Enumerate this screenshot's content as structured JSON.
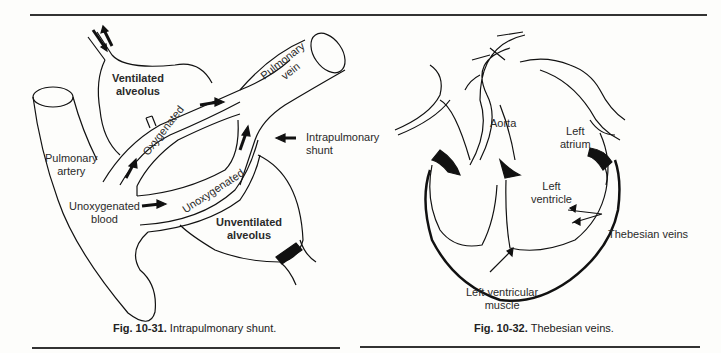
{
  "figures": [
    {
      "id": "fig-10-31",
      "caption_number": "Fig. 10-31.",
      "caption_text": "Intrapulmonary shunt.",
      "labels": {
        "ventilated_alveolus_1": "Ventilated",
        "ventilated_alveolus_2": "alveolus",
        "pulmonary_vein_1": "Pulmonary",
        "pulmonary_vein_2": "vein",
        "oxygenated": "Oxygenated",
        "intrapulmonary_shunt_1": "Intrapulmonary",
        "intrapulmonary_shunt_2": "shunt",
        "pulmonary_artery_1": "Pulmonary",
        "pulmonary_artery_2": "artery",
        "unoxygenated_blood_1": "Unoxygenated",
        "unoxygenated_blood_2": "blood",
        "unoxygenated": "Unoxygenated",
        "unventilated_alveolus_1": "Unventilated",
        "unventilated_alveolus_2": "alveolus"
      }
    },
    {
      "id": "fig-10-32",
      "caption_number": "Fig. 10-32.",
      "caption_text": "Thebesian veins.",
      "labels": {
        "aorta": "Aorta",
        "left_atrium_1": "Left",
        "left_atrium_2": "atrium",
        "left_ventricle_1": "Left",
        "left_ventricle_2": "ventricle",
        "thebesian_veins": "Thebesian veins",
        "lv_muscle_1": "Left ventricular",
        "lv_muscle_2": "muscle"
      }
    }
  ]
}
